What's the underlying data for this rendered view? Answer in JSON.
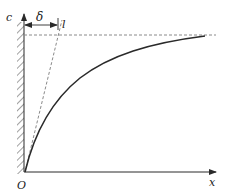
{
  "diagram": {
    "type": "concentration-profile",
    "labels": {
      "y_axis": "c",
      "x_axis": "x",
      "origin": "O",
      "delta": "δ",
      "tangent_marker": "l"
    },
    "colors": {
      "line": "#2a2a2a",
      "dashed": "#8a8a8a",
      "background": "#ffffff"
    }
  }
}
